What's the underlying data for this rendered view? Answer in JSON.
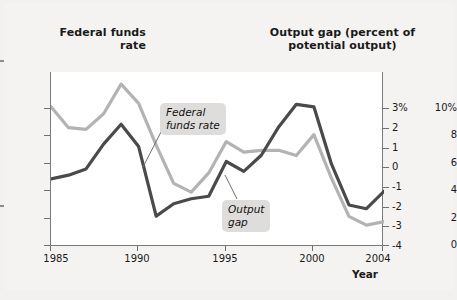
{
  "titles": {
    "left": "Federal\nfunds\nrate",
    "right": "Output gap\n(percent of\npotential output)"
  },
  "annotations": {
    "ffr": "Federal\nfunds rate",
    "gap": "Output\ngap"
  },
  "axis": {
    "x_label": "Year",
    "x_ticks": [
      "1985",
      "1990",
      "1995",
      "2000",
      "2004"
    ],
    "y_left_ticks": [
      "10%",
      "8",
      "6",
      "4",
      "2",
      "0"
    ],
    "y_right_ticks": [
      "3%",
      "2",
      "1",
      "0",
      "-1",
      "-2",
      "-3",
      "-4"
    ]
  },
  "colors": {
    "federal_funds_rate_line": "#b3b3b3",
    "output_gap_line": "#4a4a4a",
    "plot_background": "#ffffff",
    "page_background": "#f2f1ef",
    "annotation_background": "#dedddb",
    "axis": "#7a7a7a"
  },
  "chart_data": {
    "type": "line",
    "title": "",
    "xlabel": "Year",
    "ylabel": "Federal funds rate",
    "ylabel_right": "Output gap (percent of potential output)",
    "grid": false,
    "legend": "annotations",
    "xlim": [
      1985,
      2004
    ],
    "ylim_left": [
      0,
      10
    ],
    "ylim_right": [
      -4,
      3
    ],
    "x": [
      1985,
      1986,
      1987,
      1988,
      1989,
      1990,
      1991,
      1992,
      1993,
      1994,
      1995,
      1996,
      1997,
      1998,
      1999,
      2000,
      2001,
      2002,
      2003,
      2004
    ],
    "series": [
      {
        "name": "Federal funds rate",
        "axis": "left",
        "units": "percent",
        "color": "#b3b3b3",
        "values": [
          8.0,
          6.8,
          6.7,
          7.6,
          9.3,
          8.2,
          5.8,
          3.6,
          3.1,
          4.2,
          6.0,
          5.4,
          5.5,
          5.5,
          5.2,
          6.4,
          3.9,
          1.7,
          1.2,
          1.4
        ]
      },
      {
        "name": "Output gap",
        "axis": "right",
        "units": "percent of potential output",
        "color": "#4a4a4a",
        "values": [
          -1.3,
          -1.15,
          -0.9,
          0.1,
          0.9,
          0.0,
          -2.8,
          -2.3,
          -2.1,
          -2.0,
          -0.6,
          -1.0,
          -0.35,
          0.8,
          1.7,
          1.6,
          -0.7,
          -2.35,
          -2.5,
          -1.8
        ]
      }
    ]
  }
}
